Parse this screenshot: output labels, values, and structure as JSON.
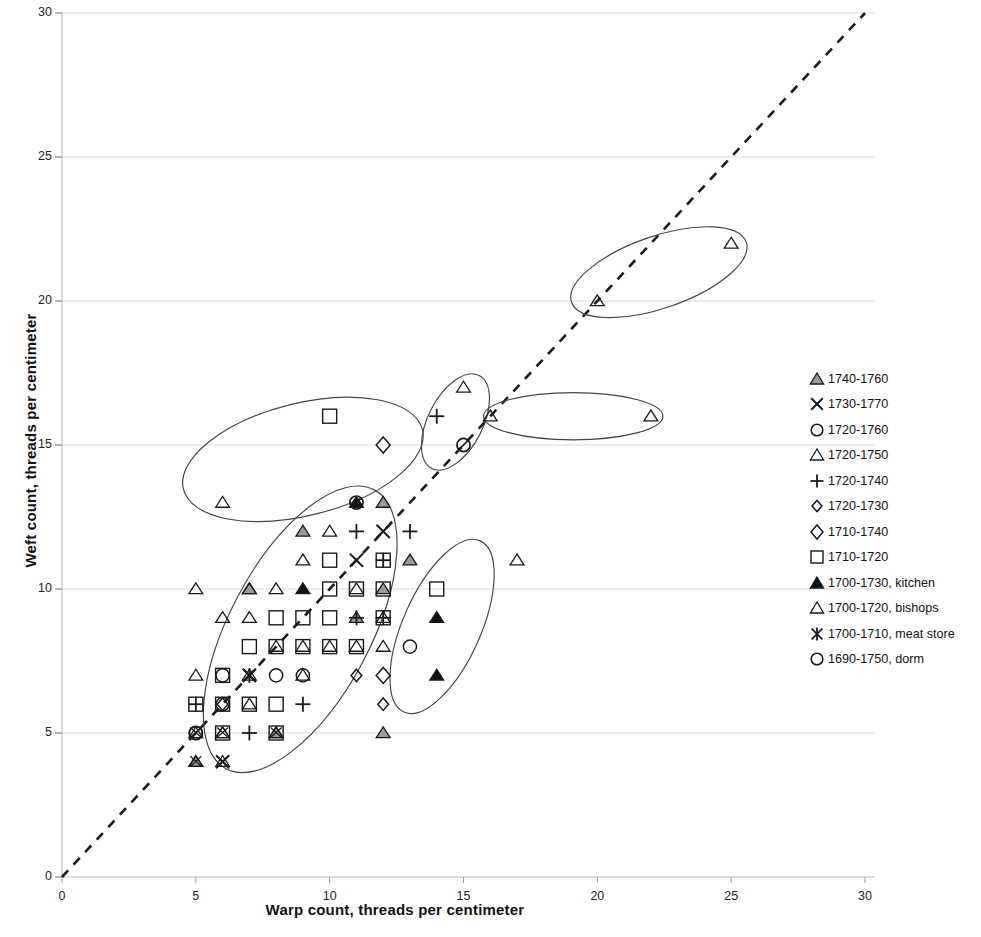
{
  "chart_data": {
    "type": "scatter",
    "title": "",
    "xlabel": "Warp count, threads per centimeter",
    "ylabel": "Weft count, threads per centimeter",
    "xlim": [
      0,
      30
    ],
    "ylim": [
      0,
      30
    ],
    "xticks": [
      0,
      5,
      10,
      15,
      20,
      25,
      30
    ],
    "yticks": [
      0,
      5,
      10,
      15,
      20,
      25,
      30
    ],
    "grid": "horizontal",
    "legend_position": "right",
    "reference_line": {
      "type": "dashed",
      "from": [
        0,
        0
      ],
      "to": [
        30,
        30
      ],
      "label": "1:1 diagonal"
    },
    "series": [
      {
        "name": "1740-1760",
        "marker": "triangle-gray",
        "points": [
          [
            9,
            12
          ],
          [
            13,
            11
          ],
          [
            12,
            5
          ],
          [
            8,
            5
          ],
          [
            12,
            10
          ],
          [
            7,
            10
          ],
          [
            5,
            4
          ],
          [
            11,
            9
          ],
          [
            12,
            13
          ]
        ]
      },
      {
        "name": "1730-1770",
        "marker": "x-cross",
        "points": [
          [
            11,
            11
          ],
          [
            12,
            12
          ],
          [
            7,
            7
          ],
          [
            6,
            4
          ]
        ]
      },
      {
        "name": "1720-1760",
        "marker": "circle",
        "points": [
          [
            13,
            8
          ],
          [
            8,
            7
          ],
          [
            9,
            7
          ],
          [
            6,
            7
          ],
          [
            5,
            5
          ],
          [
            6,
            6
          ]
        ]
      },
      {
        "name": "1720-1750",
        "marker": "triangle-open",
        "points": [
          [
            10,
            12
          ],
          [
            9,
            11
          ],
          [
            7,
            10
          ],
          [
            8,
            10
          ],
          [
            6,
            13
          ],
          [
            5,
            7
          ],
          [
            9,
            7
          ],
          [
            6,
            5
          ],
          [
            12,
            8
          ],
          [
            17,
            11
          ],
          [
            16,
            16
          ],
          [
            22,
            16
          ],
          [
            15,
            17
          ],
          [
            20,
            20
          ],
          [
            25,
            22
          ],
          [
            7,
            9
          ],
          [
            11,
            10
          ],
          [
            8,
            8
          ],
          [
            10,
            8
          ],
          [
            11,
            8
          ],
          [
            12,
            9
          ],
          [
            9,
            8
          ],
          [
            7,
            6
          ],
          [
            6,
            9
          ],
          [
            5,
            10
          ]
        ]
      },
      {
        "name": "1720-1740",
        "marker": "plus",
        "points": [
          [
            11,
            12
          ],
          [
            13,
            12
          ],
          [
            11,
            9
          ],
          [
            9,
            6
          ],
          [
            7,
            5
          ],
          [
            14,
            16
          ],
          [
            12,
            11
          ],
          [
            5,
            6
          ],
          [
            12,
            9
          ]
        ]
      },
      {
        "name": "1720-1730",
        "marker": "diamond-small",
        "points": [
          [
            11,
            7
          ],
          [
            12,
            6
          ],
          [
            6,
            6
          ]
        ]
      },
      {
        "name": "1710-1740",
        "marker": "diamond",
        "points": [
          [
            12,
            15
          ],
          [
            12,
            7
          ]
        ]
      },
      {
        "name": "1710-1720",
        "marker": "square",
        "points": [
          [
            10,
            16
          ],
          [
            10,
            11
          ],
          [
            8,
            9
          ],
          [
            9,
            9
          ],
          [
            12,
            9
          ],
          [
            12,
            11
          ],
          [
            14,
            10
          ],
          [
            6,
            7
          ],
          [
            5,
            6
          ],
          [
            6,
            6
          ],
          [
            7,
            6
          ],
          [
            8,
            6
          ],
          [
            10,
            9
          ],
          [
            11,
            10
          ],
          [
            12,
            10
          ],
          [
            8,
            5
          ],
          [
            7,
            8
          ],
          [
            8,
            8
          ],
          [
            9,
            8
          ],
          [
            10,
            8
          ],
          [
            11,
            8
          ],
          [
            10,
            10
          ],
          [
            6,
            5
          ]
        ]
      },
      {
        "name": "1700-1730, kitchen",
        "marker": "triangle-filled",
        "points": [
          [
            14,
            9
          ],
          [
            14,
            7
          ],
          [
            11,
            13
          ],
          [
            9,
            10
          ]
        ]
      },
      {
        "name": "1700-1720, bishops",
        "marker": "triangle-bishops",
        "points": [
          [
            5,
            4
          ],
          [
            6,
            4
          ],
          [
            8,
            5
          ],
          [
            5,
            5
          ],
          [
            6,
            5
          ],
          [
            7,
            7
          ]
        ]
      },
      {
        "name": "1700-1710, meat store",
        "marker": "star-cross",
        "points": [
          [
            7,
            7
          ]
        ]
      },
      {
        "name": "1690-1750, dorm",
        "marker": "circle-dorm",
        "points": [
          [
            15,
            15
          ],
          [
            11,
            13
          ],
          [
            5,
            5
          ]
        ]
      }
    ],
    "ellipses": [
      {
        "cx": 9.0,
        "cy": 14.5,
        "rx": 4.6,
        "ry": 1.95,
        "rot": -14
      },
      {
        "cx": 8.9,
        "cy": 8.6,
        "rx": 5.9,
        "ry": 2.45,
        "rot": -62
      },
      {
        "cx": 14.2,
        "cy": 8.7,
        "rx": 3.5,
        "ry": 1.35,
        "rot": -66
      },
      {
        "cx": 14.7,
        "cy": 15.8,
        "rx": 1.95,
        "ry": 0.95,
        "rot": -63
      },
      {
        "cx": 19.1,
        "cy": 16.0,
        "rx": 3.35,
        "ry": 0.82,
        "rot": 0
      },
      {
        "cx": 22.3,
        "cy": 21.0,
        "rx": 3.45,
        "ry": 1.25,
        "rot": -19
      }
    ]
  },
  "legend": {
    "items": [
      {
        "label": "1740-1760",
        "marker": "triangle-gray"
      },
      {
        "label": "1730-1770",
        "marker": "x-cross"
      },
      {
        "label": "1720-1760",
        "marker": "circle"
      },
      {
        "label": "1720-1750",
        "marker": "triangle-open"
      },
      {
        "label": "1720-1740",
        "marker": "plus"
      },
      {
        "label": "1720-1730",
        "marker": "diamond-small"
      },
      {
        "label": "1710-1740",
        "marker": "diamond"
      },
      {
        "label": "1710-1720",
        "marker": "square"
      },
      {
        "label": "1700-1730, kitchen",
        "marker": "triangle-filled"
      },
      {
        "label": "1700-1720, bishops",
        "marker": "triangle-bishops"
      },
      {
        "label": "1700-1710, meat store",
        "marker": "star-cross"
      },
      {
        "label": "1690-1750, dorm",
        "marker": "circle-dorm"
      }
    ]
  },
  "colors": {
    "marker_stroke": "#1a1a1a",
    "marker_gray_fill": "#9a9a9a",
    "grid": "#d9d9d9",
    "axis": "#bdbdbd",
    "ellipse": "#444444",
    "dashed_line": "#1a1a1a"
  }
}
